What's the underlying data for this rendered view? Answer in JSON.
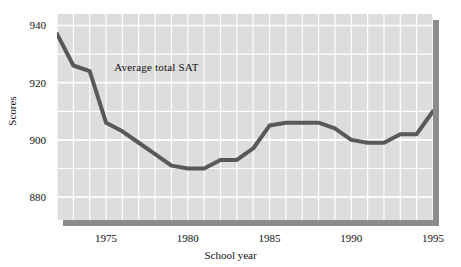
{
  "chart_data": {
    "type": "line",
    "title": "",
    "xlabel": "School year",
    "ylabel": "Scores",
    "xlim": [
      1972,
      1995
    ],
    "ylim": [
      872,
      944
    ],
    "grid": true,
    "legend_position": "inline-annotation",
    "x_ticks": [
      1975,
      1980,
      1985,
      1990,
      1995
    ],
    "x_tick_labels": [
      "1975",
      "1980",
      "1985",
      "1990",
      "1995"
    ],
    "y_ticks": [
      880,
      900,
      920,
      940
    ],
    "y_tick_labels": [
      "880",
      "900",
      "920",
      "940"
    ],
    "annotations": [
      {
        "text": "Average total SAT",
        "x": 1975.5,
        "y": 925
      }
    ],
    "series": [
      {
        "name": "Average total SAT",
        "color": "#595959",
        "line_width": 4,
        "x": [
          1972,
          1973,
          1974,
          1975,
          1976,
          1977,
          1978,
          1979,
          1980,
          1981,
          1982,
          1983,
          1984,
          1985,
          1986,
          1987,
          1988,
          1989,
          1990,
          1991,
          1992,
          1993,
          1994,
          1995
        ],
        "values": [
          937,
          926,
          924,
          906,
          903,
          899,
          895,
          891,
          890,
          890,
          893,
          893,
          897,
          905,
          906,
          906,
          906,
          904,
          900,
          899,
          899,
          902,
          902,
          910
        ]
      }
    ]
  },
  "axes": {
    "y_title": "Scores",
    "x_title": "School year"
  },
  "colors": {
    "plot_background": "#dddddd",
    "grid_line": "#ffffff",
    "series_line": "#595959",
    "shadow": "#8c8c8c",
    "text": "#111111",
    "page_background": "#ffffff"
  }
}
